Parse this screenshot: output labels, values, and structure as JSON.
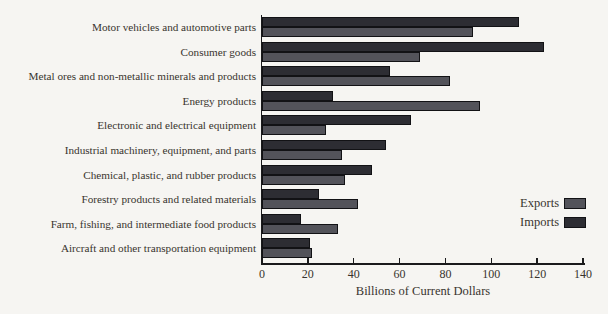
{
  "chart_data": {
    "type": "bar",
    "orientation": "horizontal",
    "title": "",
    "xlabel": "Billions of Current Dollars",
    "xlim": [
      0,
      140
    ],
    "x_ticks": [
      0,
      20,
      40,
      60,
      80,
      100,
      120,
      140
    ],
    "grid": false,
    "legend_position": "right",
    "categories": [
      "Motor vehicles and automotive parts",
      "Consumer goods",
      "Metal ores and non-metallic minerals and products",
      "Energy products",
      "Electronic and electrical equipment",
      "Industrial machinery, equipment, and parts",
      "Chemical, plastic, and rubber products",
      "Forestry products and related materials",
      "Farm, fishing, and intermediate food products",
      "Aircraft and other transportation equipment"
    ],
    "series": [
      {
        "name": "Imports",
        "color": "#2d2d33",
        "values": [
          112,
          123,
          56,
          31,
          65,
          54,
          48,
          25,
          17,
          21
        ]
      },
      {
        "name": "Exports",
        "color": "#53535a",
        "values": [
          92,
          69,
          82,
          95,
          28,
          35,
          36,
          42,
          33,
          22
        ]
      }
    ],
    "legend": [
      {
        "label": "Exports",
        "color": "#53535a"
      },
      {
        "label": "Imports",
        "color": "#2d2d33"
      }
    ]
  },
  "colors": {
    "background": "#f6f5f2",
    "text": "#38342e",
    "axis": "#1a1a1c",
    "bar_border": "#121215"
  }
}
